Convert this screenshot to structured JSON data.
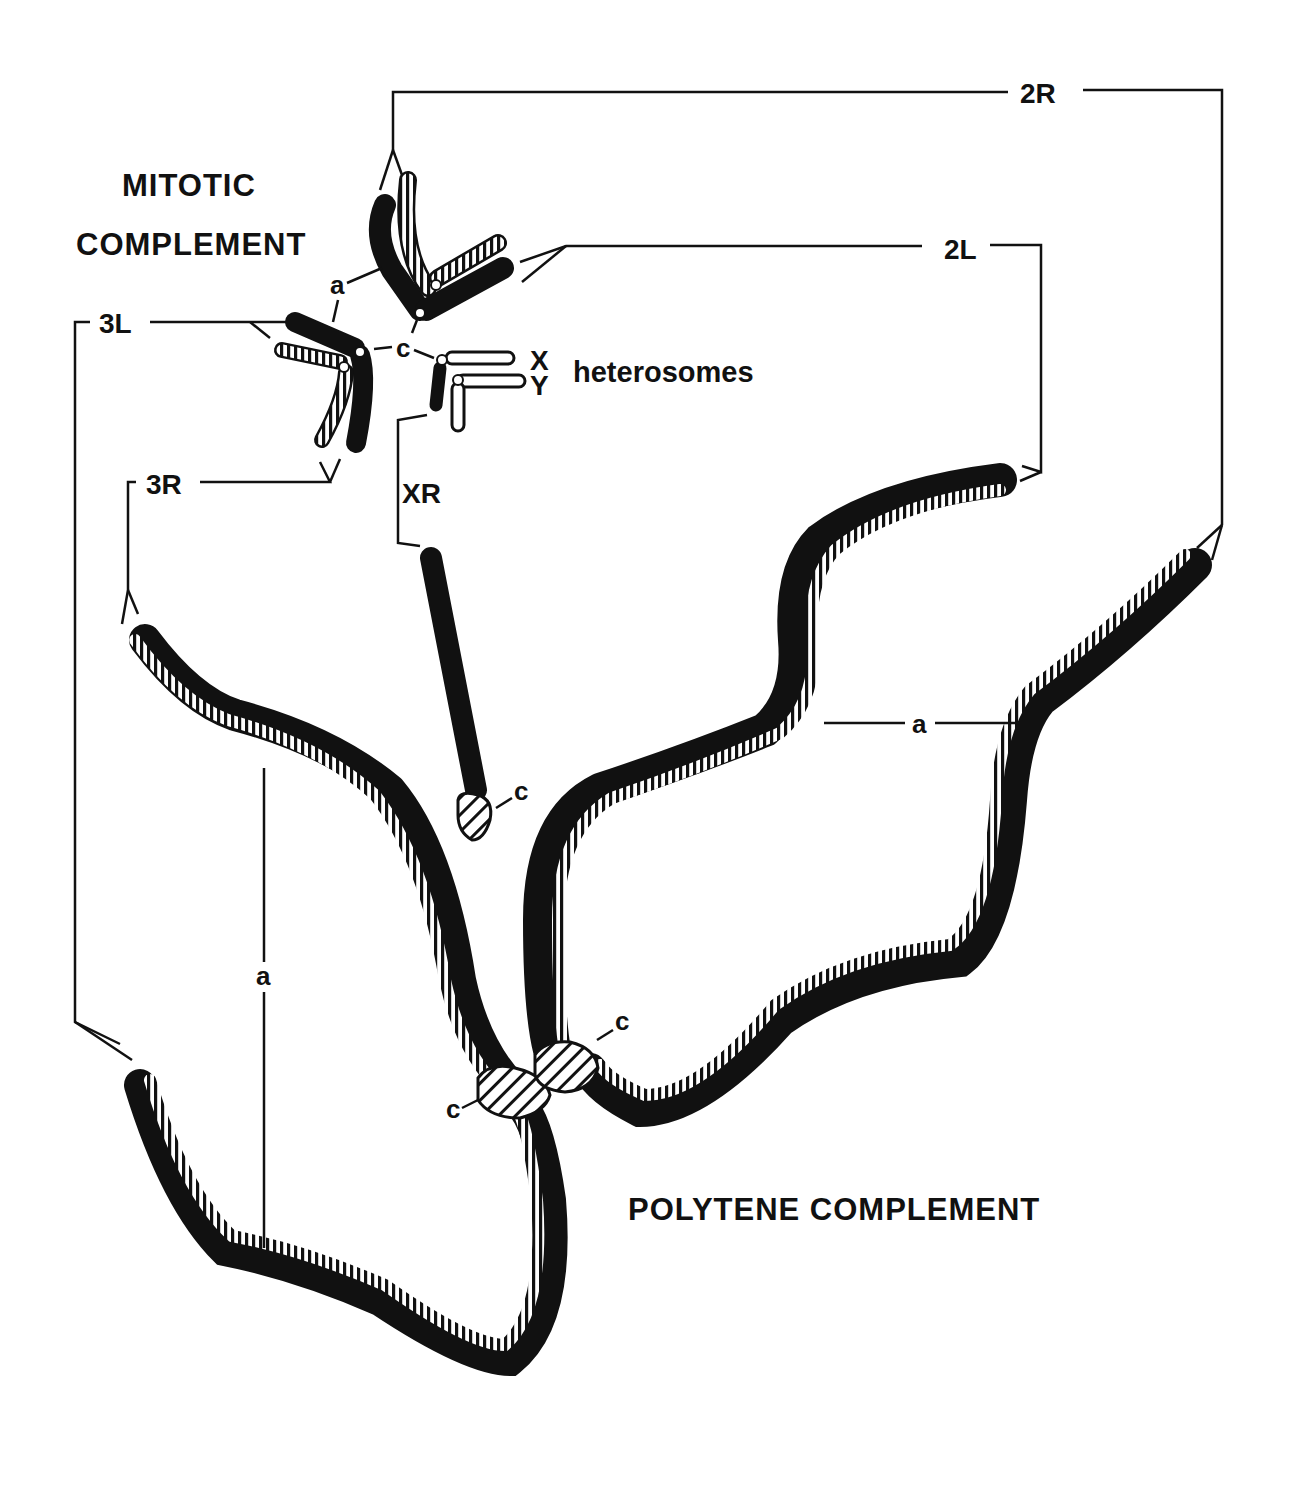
{
  "figure": {
    "mitotic_title_line1": "MITOTIC",
    "mitotic_title_line2": "COMPLEMENT",
    "polytene_title": "POLYTENE COMPLEMENT",
    "heterosomes_label": "heterosomes",
    "arm_labels": {
      "2R": "2R",
      "2L": "2L",
      "3L": "3L",
      "3R": "3R",
      "XR": "XR",
      "X": "X",
      "Y": "Y"
    },
    "marker_labels": {
      "a_mitotic": "a",
      "c_mitotic": "c",
      "c_xr": "c",
      "c_polytene_right": "c",
      "c_polytene_left": "c",
      "a_polytene_2": "a",
      "a_polytene_3": "a"
    },
    "colors": {
      "ink": "#111111",
      "background": "#ffffff"
    }
  }
}
